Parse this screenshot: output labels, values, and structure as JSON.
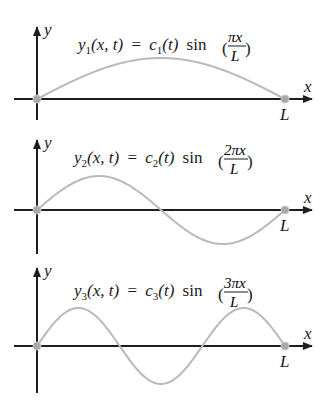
{
  "figure": {
    "panels": [
      {
        "mode": 1,
        "equation": {
          "lhs_var": "y",
          "lhs_sub": "1",
          "lhs_args": "(x, t)",
          "eq": "=",
          "coef": "c",
          "coef_sub": "1",
          "coef_args": "(t)",
          "func": "sin",
          "num": "πx",
          "den": "L"
        },
        "axis_labels": {
          "x": "x",
          "y": "y",
          "end": "L"
        },
        "half_wavelengths": 1
      },
      {
        "mode": 2,
        "equation": {
          "lhs_var": "y",
          "lhs_sub": "2",
          "lhs_args": "(x, t)",
          "eq": "=",
          "coef": "c",
          "coef_sub": "2",
          "coef_args": "(t)",
          "func": "sin",
          "num": "2πx",
          "den": "L"
        },
        "axis_labels": {
          "x": "x",
          "y": "y",
          "end": "L"
        },
        "half_wavelengths": 2
      },
      {
        "mode": 3,
        "equation": {
          "lhs_var": "y",
          "lhs_sub": "3",
          "lhs_args": "(x, t)",
          "eq": "=",
          "coef": "c",
          "coef_sub": "3",
          "coef_args": "(t)",
          "func": "sin",
          "num": "3πx",
          "den": "L"
        },
        "axis_labels": {
          "x": "x",
          "y": "y",
          "end": "L"
        },
        "half_wavelengths": 3
      }
    ],
    "colors": {
      "axis": "#1e1e1e",
      "curve": "#b9b9b9",
      "node": "#a8a8a8"
    }
  }
}
